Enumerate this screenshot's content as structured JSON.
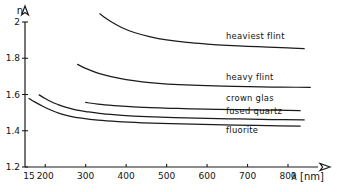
{
  "chart_data": {
    "type": "line",
    "title": "",
    "subtitle": "",
    "xlabel": "λ [nm]",
    "ylabel": "n",
    "xlim": [
      150,
      870
    ],
    "ylim": [
      1.2,
      2.05
    ],
    "grid": false,
    "legend_position": "inline-right",
    "x_ticks": [
      150,
      200,
      300,
      400,
      500,
      600,
      700,
      800
    ],
    "x_tick_labels": [
      "15",
      "200",
      "300",
      "400",
      "500",
      "600",
      "700",
      "800"
    ],
    "y_ticks": [
      1.2,
      1.4,
      1.6,
      1.8,
      2.0
    ],
    "y_tick_labels": [
      "1.2",
      "1.4",
      "1.6",
      "1.8",
      "2"
    ],
    "annotations": [
      "heaviest flint",
      "heavy flint",
      "crown glas",
      "fused quartz",
      "fluorite"
    ],
    "series": [
      {
        "name": "heaviest flint",
        "label": "heaviest flint",
        "x": [
          335,
          360,
          390,
          420,
          460,
          500,
          550,
          600,
          650,
          700,
          750,
          800,
          840
        ],
        "values": [
          2.045,
          2.005,
          1.968,
          1.942,
          1.918,
          1.901,
          1.887,
          1.878,
          1.871,
          1.866,
          1.861,
          1.857,
          1.853
        ]
      },
      {
        "name": "heavy flint",
        "label": "heavy flint",
        "x": [
          280,
          300,
          330,
          360,
          400,
          440,
          480,
          530,
          580,
          640,
          700,
          760,
          820,
          855
        ],
        "values": [
          1.766,
          1.744,
          1.718,
          1.7,
          1.682,
          1.67,
          1.662,
          1.655,
          1.65,
          1.646,
          1.643,
          1.641,
          1.64,
          1.639
        ]
      },
      {
        "name": "crown glas",
        "label": "crown glas",
        "x": [
          300,
          330,
          370,
          410,
          460,
          510,
          560,
          620,
          680,
          740,
          800,
          830
        ],
        "values": [
          1.556,
          1.547,
          1.539,
          1.533,
          1.528,
          1.524,
          1.521,
          1.518,
          1.516,
          1.514,
          1.512,
          1.511
        ]
      },
      {
        "name": "fused quartz",
        "label": "fused quartz",
        "x": [
          185,
          200,
          215,
          230,
          250,
          275,
          300,
          340,
          390,
          450,
          520,
          600,
          680,
          760,
          840
        ],
        "values": [
          1.598,
          1.578,
          1.56,
          1.546,
          1.53,
          1.515,
          1.506,
          1.494,
          1.485,
          1.478,
          1.473,
          1.468,
          1.465,
          1.462,
          1.46
        ]
      },
      {
        "name": "fluorite",
        "label": "fluorite",
        "x": [
          160,
          175,
          195,
          215,
          235,
          260,
          290,
          330,
          380,
          440,
          510,
          590,
          670,
          750,
          830
        ],
        "values": [
          1.578,
          1.558,
          1.534,
          1.513,
          1.496,
          1.481,
          1.469,
          1.458,
          1.45,
          1.444,
          1.439,
          1.435,
          1.431,
          1.428,
          1.425
        ]
      }
    ]
  },
  "axes": {
    "y_title": "n",
    "x_title_symbol": "λ",
    "x_title_unit": "[nm]"
  },
  "labels": {
    "heaviest_flint": "heaviest flint",
    "heavy_flint": "heavy flint",
    "crown_glas": "crown glas",
    "fused_quartz": "fused quartz",
    "fluorite": "fluorite"
  },
  "colors": {
    "ink": "#1b1b1b",
    "background": "#ffffff"
  }
}
